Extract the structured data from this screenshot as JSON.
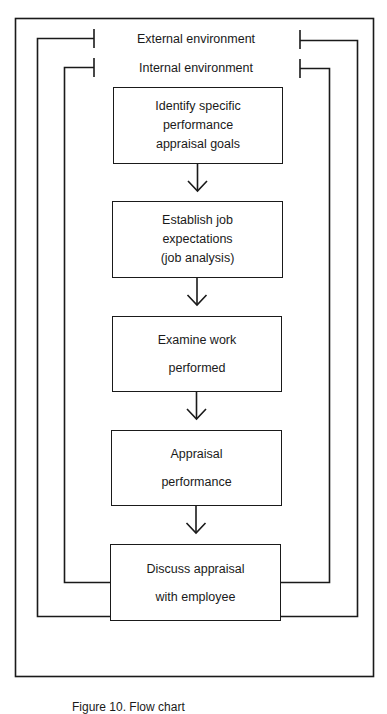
{
  "diagram": {
    "type": "nested-flowchart",
    "environments": {
      "external": {
        "label": "External environment"
      },
      "internal": {
        "label": "Internal environment"
      }
    },
    "steps": [
      {
        "id": "step-1",
        "lines": [
          "Identify specific",
          "performance",
          "appraisal goals"
        ]
      },
      {
        "id": "step-2",
        "lines": [
          "Establish job",
          "expectations",
          "(job analysis)"
        ]
      },
      {
        "id": "step-3",
        "lines": [
          "Examine work",
          "performed"
        ]
      },
      {
        "id": "step-4",
        "lines": [
          "Appraisal",
          "performance"
        ]
      },
      {
        "id": "step-5",
        "lines": [
          "Discuss appraisal",
          "with employee"
        ]
      }
    ],
    "arrows": [
      {
        "from": "step-1",
        "to": "step-2",
        "icon": "down-arrow-icon"
      },
      {
        "from": "step-2",
        "to": "step-3",
        "icon": "down-arrow-icon"
      },
      {
        "from": "step-3",
        "to": "step-4",
        "icon": "down-arrow-icon"
      },
      {
        "from": "step-4",
        "to": "step-5",
        "icon": "down-arrow-icon"
      }
    ],
    "colors": {
      "stroke": "#1a1a1a",
      "background": "#ffffff"
    }
  },
  "caption": {
    "text": "Figure 10.  Flow chart"
  }
}
